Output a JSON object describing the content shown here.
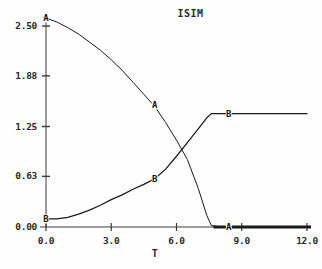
{
  "chart_data": {
    "type": "line",
    "title": "ISIM",
    "xlabel": "T",
    "ylabel": "",
    "xlim": [
      0.0,
      12.0
    ],
    "ylim": [
      0.0,
      2.6
    ],
    "grid": false,
    "legend": "inline-curve-labels",
    "x_ticks": [
      "0.0",
      "3.0",
      "6.0",
      "9.0",
      "12.0"
    ],
    "x_tick_values": [
      0.0,
      3.0,
      6.0,
      9.0,
      12.0
    ],
    "y_ticks": [
      "0.00",
      "0.63",
      "1.25",
      "1.88",
      "2.50"
    ],
    "y_tick_values": [
      0.0,
      0.63,
      1.25,
      1.88,
      2.5
    ],
    "series": [
      {
        "name": "A",
        "label_at": {
          "x": 5.0,
          "y": 1.52
        },
        "endpoint_label_at": {
          "x": 8.4,
          "y": 0.0
        },
        "x": [
          0.0,
          0.5,
          1.0,
          1.5,
          2.0,
          2.5,
          3.0,
          3.5,
          4.0,
          4.5,
          5.0,
          5.5,
          6.0,
          6.5,
          7.0,
          7.4,
          7.6,
          8.0,
          9.0,
          10.0,
          11.0,
          12.0
        ],
        "values": [
          2.6,
          2.55,
          2.48,
          2.4,
          2.3,
          2.2,
          2.08,
          1.95,
          1.8,
          1.65,
          1.5,
          1.3,
          1.08,
          0.84,
          0.48,
          0.14,
          0.02,
          0.0,
          0.0,
          0.0,
          0.0,
          0.0
        ]
      },
      {
        "name": "B",
        "label_at": {
          "x": 5.0,
          "y": 0.6
        },
        "plateau_label_at": {
          "x": 8.4,
          "y": 1.41
        },
        "x": [
          0.0,
          0.5,
          1.0,
          1.5,
          2.0,
          2.5,
          3.0,
          3.5,
          4.0,
          4.5,
          5.0,
          5.5,
          6.0,
          6.5,
          7.0,
          7.4,
          7.6,
          8.0,
          9.0,
          10.0,
          11.0,
          12.0
        ],
        "values": [
          0.1,
          0.1,
          0.12,
          0.16,
          0.21,
          0.27,
          0.34,
          0.4,
          0.47,
          0.53,
          0.6,
          0.72,
          0.88,
          1.05,
          1.22,
          1.36,
          1.41,
          1.41,
          1.41,
          1.41,
          1.41,
          1.41
        ]
      }
    ],
    "annotations": [
      {
        "text": "A",
        "x": 0.0,
        "y": 2.6
      },
      {
        "text": "A",
        "x": 5.0,
        "y": 1.52
      },
      {
        "text": "A",
        "x": 8.4,
        "y": 0.0
      },
      {
        "text": "B",
        "x": 0.0,
        "y": 0.1
      },
      {
        "text": "B",
        "x": 5.0,
        "y": 0.6
      },
      {
        "text": "B",
        "x": 8.4,
        "y": 1.41
      }
    ],
    "colors": {
      "curve": "#1a1a1a",
      "axis": "#3a3a3a",
      "background": "#fefefe",
      "text": "#2a2a2a"
    }
  }
}
